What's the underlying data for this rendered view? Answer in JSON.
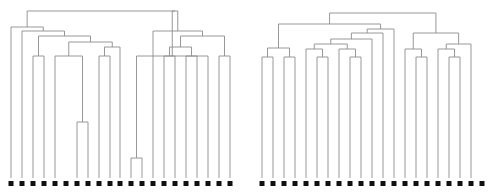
{
  "figure": {
    "title": "",
    "background_color": "#ffffff",
    "link_color": "#8c8c8c",
    "leaf_marker_color": "#101010",
    "leaf_marker_size": 5,
    "line_width": 0.9,
    "width": 492,
    "height": 194
  },
  "chart_data": {
    "type": "tree",
    "subtype": "dendrogram",
    "panel_count": 2,
    "title": "",
    "xlabel": "",
    "ylabel": "",
    "grid": false,
    "legend": false,
    "axis_visible": false,
    "orientation": "top-down",
    "panels": [
      {
        "name": "left-dendrogram",
        "leaf_count": 21,
        "baseline_y": 178,
        "leaf_x": [
          11,
          22,
          33,
          44,
          55,
          66,
          77,
          88,
          99,
          110,
          120,
          131,
          142,
          153,
          164,
          175,
          186,
          197,
          208,
          219,
          230
        ],
        "leaf_labels": [
          "",
          "",
          "",
          "",
          "",
          "",
          "",
          "",
          "",
          "",
          "",
          "",
          "",
          "",
          "",
          "",
          "",
          "",
          "",
          "",
          ""
        ],
        "merges": [
          {
            "id": "m1",
            "left": 6,
            "right": 7,
            "height": 122
          },
          {
            "id": "m2",
            "left": 11,
            "right": 12,
            "height": 158
          },
          {
            "id": "m3",
            "left": 4,
            "right": "m1",
            "height": 56
          },
          {
            "id": "m4",
            "left": 2,
            "right": 3,
            "height": 56
          },
          {
            "id": "m5",
            "left": 8,
            "right": 9,
            "height": 56
          },
          {
            "id": "m6",
            "left": "m5",
            "height_pair": true,
            "right": 10,
            "height": 47
          },
          {
            "id": "m7",
            "left": "m3",
            "right": "m6",
            "height": 42
          },
          {
            "id": "m8",
            "left": "m4",
            "right": "m7",
            "height": 36
          },
          {
            "id": "m9",
            "left": 1,
            "right": "m8",
            "height": 31
          },
          {
            "id": "m10",
            "left": 0,
            "right": "m9",
            "height": 27
          },
          {
            "id": "m11",
            "left": 14,
            "right": 15,
            "height": 56
          },
          {
            "id": "m12",
            "left": 16,
            "right": 17,
            "height": 56
          },
          {
            "id": "m13",
            "left": "m11",
            "right": "m12",
            "height": 47
          },
          {
            "id": "m14",
            "left": 19,
            "right": 20,
            "height": 56
          },
          {
            "id": "m15",
            "left": "m13",
            "right": "m14",
            "height": 36
          },
          {
            "id": "m16",
            "left": 13,
            "right": "m15",
            "height": 31
          },
          {
            "id": "m17",
            "left": "m2",
            "right": 18,
            "height": 56
          },
          {
            "id": "m18",
            "left": "m17",
            "right": "m16",
            "height": 11
          },
          {
            "id": "m19",
            "left": "m10",
            "right": "m18",
            "height": 11
          }
        ]
      },
      {
        "name": "right-dendrogram",
        "leaf_count": 21,
        "baseline_y": 178,
        "leaf_x": [
          262,
          273,
          284,
          295,
          306,
          317,
          328,
          339,
          350,
          361,
          372,
          383,
          394,
          405,
          416,
          427,
          438,
          449,
          460,
          471,
          482
        ],
        "leaf_labels": [
          "",
          "",
          "",
          "",
          "",
          "",
          "",
          "",
          "",
          "",
          "",
          "",
          "",
          "",
          "",
          "",
          "",
          "",
          "",
          "",
          ""
        ],
        "merges": [
          {
            "id": "r1",
            "left": 0,
            "right": 1,
            "height": 57
          },
          {
            "id": "r2",
            "left": 2,
            "right": 3,
            "height": 57
          },
          {
            "id": "r3",
            "left": "r1",
            "right": "r2",
            "height": 48
          },
          {
            "id": "r4",
            "left": 5,
            "right": 6,
            "height": 57
          },
          {
            "id": "r5",
            "left": 4,
            "right": "r4",
            "height": 49
          },
          {
            "id": "r6",
            "left": 8,
            "right": 9,
            "height": 57
          },
          {
            "id": "r7",
            "left": 7,
            "right": "r6",
            "height": 49
          },
          {
            "id": "r8",
            "left": "r5",
            "right": "r7",
            "height": 44
          },
          {
            "id": "r9",
            "left": "r8",
            "right": 10,
            "height": 39
          },
          {
            "id": "r10",
            "left": "r9",
            "right": 11,
            "height": 33
          },
          {
            "id": "r11",
            "left": "r10",
            "right": 12,
            "height": 29
          },
          {
            "id": "r12",
            "left": "r3",
            "right": "r11",
            "height": 24
          },
          {
            "id": "r13",
            "left": 14,
            "right": 15,
            "height": 57
          },
          {
            "id": "r14",
            "left": 13,
            "right": "r13",
            "height": 49
          },
          {
            "id": "r15",
            "left": 17,
            "right": 18,
            "height": 57
          },
          {
            "id": "r16",
            "left": 16,
            "right": "r15",
            "height": 49
          },
          {
            "id": "r17",
            "left": "r16",
            "right": 19,
            "height": 44
          },
          {
            "id": "r18",
            "left": "r14",
            "right": "r17",
            "height": 33
          },
          {
            "id": "r19",
            "left": "r12",
            "right": "r18",
            "height": 13
          }
        ]
      }
    ]
  }
}
